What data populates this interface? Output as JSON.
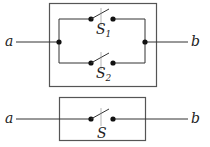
{
  "diagram": {
    "type": "switch-circuit",
    "colors": {
      "line": "#333333",
      "box": "#555555",
      "background": "#ffffff"
    },
    "top_circuit": {
      "description": "Two switches in parallel between a and b",
      "terminal_left": "a",
      "terminal_right": "b",
      "switches": [
        {
          "label": "S",
          "subscript": "1",
          "branch": "upper"
        },
        {
          "label": "S",
          "subscript": "2",
          "branch": "lower"
        }
      ]
    },
    "bottom_circuit": {
      "description": "Single equivalent switch between a and b",
      "terminal_left": "a",
      "terminal_right": "b",
      "switch": {
        "label": "S"
      }
    }
  }
}
